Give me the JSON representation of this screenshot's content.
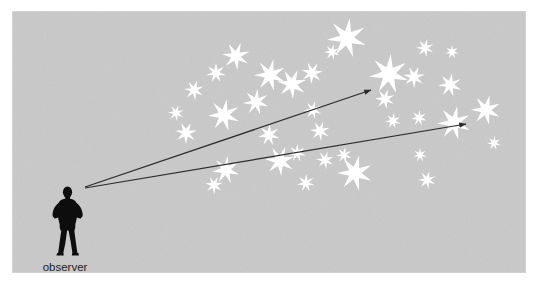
{
  "figure": {
    "canvas": {
      "width": 534,
      "height": 286
    },
    "panel": {
      "name": "sky-panel",
      "x": 13,
      "y": 12,
      "width": 512,
      "height": 260,
      "fill": "#c9c9c9",
      "edge_fill": "#d2d2d2"
    },
    "background_color": "#ffffff",
    "star_color": "#ffffff",
    "line_color": "#2b2b2b",
    "text_color": "#1c1c1c",
    "labels": [
      {
        "name": "observer-label",
        "text": "observer",
        "x": 65,
        "y": 271,
        "anchor": "middle",
        "font_size": 11.5
      }
    ],
    "observer": {
      "name": "observer-silhouette",
      "description": "standing human figure, hands on hips, legs apart",
      "fill": "#0d0d0d",
      "x": 48,
      "y": 186,
      "width": 38,
      "height": 70
    },
    "sight_lines": [
      {
        "name": "sight-line-upper",
        "from": {
          "x": 85,
          "y": 187
        },
        "to": {
          "x": 371,
          "y": 90
        },
        "stroke_width": 1.2,
        "arrowhead": true
      },
      {
        "name": "sight-line-lower",
        "from": {
          "x": 85,
          "y": 188
        },
        "to": {
          "x": 466,
          "y": 124
        },
        "stroke_width": 1.2,
        "arrowhead": true
      }
    ],
    "stars": [
      {
        "cx": 347,
        "cy": 38,
        "r": 20,
        "points": 7,
        "rot": 8
      },
      {
        "cx": 236,
        "cy": 56,
        "r": 14,
        "points": 7,
        "rot": 20
      },
      {
        "cx": 216,
        "cy": 73,
        "r": 10,
        "points": 7,
        "rot": 0
      },
      {
        "cx": 270,
        "cy": 75,
        "r": 16,
        "points": 7,
        "rot": 12
      },
      {
        "cx": 312,
        "cy": 73,
        "r": 11,
        "points": 7,
        "rot": 30
      },
      {
        "cx": 389,
        "cy": 74,
        "r": 20,
        "points": 7,
        "rot": 5
      },
      {
        "cx": 425,
        "cy": 48,
        "r": 9,
        "points": 7,
        "rot": 15
      },
      {
        "cx": 452,
        "cy": 52,
        "r": 7,
        "points": 7,
        "rot": 0
      },
      {
        "cx": 414,
        "cy": 77,
        "r": 11,
        "points": 7,
        "rot": 25
      },
      {
        "cx": 450,
        "cy": 85,
        "r": 12,
        "points": 7,
        "rot": 10
      },
      {
        "cx": 194,
        "cy": 90,
        "r": 10,
        "points": 7,
        "rot": 18
      },
      {
        "cx": 256,
        "cy": 102,
        "r": 13,
        "points": 7,
        "rot": 7
      },
      {
        "cx": 292,
        "cy": 84,
        "r": 15,
        "points": 7,
        "rot": 22
      },
      {
        "cx": 313,
        "cy": 110,
        "r": 9,
        "points": 7,
        "rot": 12
      },
      {
        "cx": 385,
        "cy": 99,
        "r": 10,
        "points": 7,
        "rot": 16
      },
      {
        "cx": 419,
        "cy": 118,
        "r": 8,
        "points": 7,
        "rot": 5
      },
      {
        "cx": 486,
        "cy": 110,
        "r": 15,
        "points": 7,
        "rot": 14
      },
      {
        "cx": 224,
        "cy": 115,
        "r": 16,
        "points": 7,
        "rot": 10
      },
      {
        "cx": 186,
        "cy": 133,
        "r": 11,
        "points": 7,
        "rot": 26
      },
      {
        "cx": 269,
        "cy": 135,
        "r": 11,
        "points": 7,
        "rot": 4
      },
      {
        "cx": 320,
        "cy": 131,
        "r": 10,
        "points": 7,
        "rot": 19
      },
      {
        "cx": 393,
        "cy": 121,
        "r": 8,
        "points": 7,
        "rot": 8
      },
      {
        "cx": 454,
        "cy": 123,
        "r": 17,
        "points": 7,
        "rot": 11
      },
      {
        "cx": 226,
        "cy": 170,
        "r": 14,
        "points": 7,
        "rot": 6
      },
      {
        "cx": 280,
        "cy": 161,
        "r": 15,
        "points": 7,
        "rot": 21
      },
      {
        "cx": 297,
        "cy": 153,
        "r": 9,
        "points": 7,
        "rot": 3
      },
      {
        "cx": 325,
        "cy": 160,
        "r": 9,
        "points": 7,
        "rot": 17
      },
      {
        "cx": 344,
        "cy": 155,
        "r": 8,
        "points": 7,
        "rot": 9
      },
      {
        "cx": 355,
        "cy": 173,
        "r": 18,
        "points": 7,
        "rot": 13
      },
      {
        "cx": 306,
        "cy": 183,
        "r": 9,
        "points": 7,
        "rot": 2
      },
      {
        "cx": 214,
        "cy": 185,
        "r": 9,
        "points": 7,
        "rot": 24
      },
      {
        "cx": 420,
        "cy": 155,
        "r": 7,
        "points": 7,
        "rot": 0
      },
      {
        "cx": 427,
        "cy": 180,
        "r": 9,
        "points": 7,
        "rot": 15
      },
      {
        "cx": 494,
        "cy": 143,
        "r": 7,
        "points": 7,
        "rot": 6
      },
      {
        "cx": 332,
        "cy": 52,
        "r": 8,
        "points": 7,
        "rot": 11
      },
      {
        "cx": 176,
        "cy": 113,
        "r": 8,
        "points": 7,
        "rot": 18
      }
    ]
  }
}
